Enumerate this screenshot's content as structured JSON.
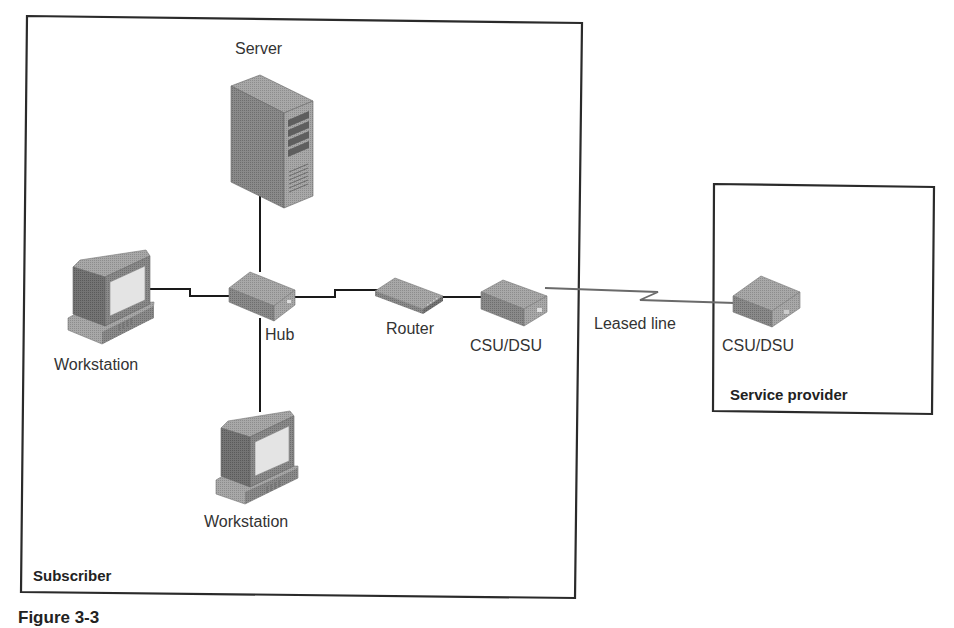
{
  "diagram": {
    "type": "network-topology",
    "zones": [
      {
        "id": "subscriber",
        "label": "Subscriber"
      },
      {
        "id": "service-provider",
        "label": "Service provider"
      }
    ],
    "nodes": [
      {
        "id": "server",
        "label": "Server",
        "zone": "subscriber",
        "icon": "server-icon"
      },
      {
        "id": "workstation-left",
        "label": "Workstation",
        "zone": "subscriber",
        "icon": "workstation-icon"
      },
      {
        "id": "hub",
        "label": "Hub",
        "zone": "subscriber",
        "icon": "hub-icon"
      },
      {
        "id": "workstation-bottom",
        "label": "Workstation",
        "zone": "subscriber",
        "icon": "workstation-icon"
      },
      {
        "id": "router",
        "label": "Router",
        "zone": "subscriber",
        "icon": "router-icon"
      },
      {
        "id": "csu-dsu-subscriber",
        "label": "CSU/DSU",
        "zone": "subscriber",
        "icon": "csu-dsu-icon"
      },
      {
        "id": "csu-dsu-provider",
        "label": "CSU/DSU",
        "zone": "service-provider",
        "icon": "csu-dsu-icon"
      }
    ],
    "edges": [
      {
        "from": "server",
        "to": "hub"
      },
      {
        "from": "workstation-left",
        "to": "hub"
      },
      {
        "from": "hub",
        "to": "workstation-bottom"
      },
      {
        "from": "hub",
        "to": "router"
      },
      {
        "from": "router",
        "to": "csu-dsu-subscriber"
      },
      {
        "from": "csu-dsu-subscriber",
        "to": "csu-dsu-provider",
        "label": "Leased line",
        "style": "lightning"
      }
    ],
    "caption": "Figure 3-3"
  },
  "labels": {
    "server": "Server",
    "workstation_left": "Workstation",
    "hub": "Hub",
    "workstation_bottom": "Workstation",
    "router": "Router",
    "csu_dsu_subscriber": "CSU/DSU",
    "leased_line": "Leased line",
    "csu_dsu_provider": "CSU/DSU",
    "subscriber": "Subscriber",
    "service_provider": "Service provider",
    "caption": "Figure 3-3"
  }
}
